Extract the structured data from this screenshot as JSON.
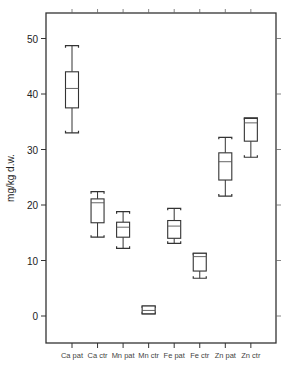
{
  "chart_data": {
    "type": "box",
    "title": "",
    "xlabel": "",
    "ylabel": "mg/kg d.w.",
    "ylim": [
      -5,
      55
    ],
    "yticks": [
      0,
      10,
      20,
      30,
      40,
      50
    ],
    "grid": false,
    "legend": null,
    "categories": [
      "Ca pat",
      "Ca ctr",
      "Mn pat",
      "Mn ctr",
      "Fe pat",
      "Fe ctr",
      "Zn pat",
      "Zn ctr"
    ],
    "series": [
      {
        "name": "Ca pat",
        "whisker_low": 33.0,
        "q1": 37.5,
        "median": 41.0,
        "q3": 44.0,
        "whisker_high": 48.7
      },
      {
        "name": "Ca ctr",
        "whisker_low": 14.2,
        "q1": 16.8,
        "median": 20.4,
        "q3": 21.1,
        "whisker_high": 22.4
      },
      {
        "name": "Mn pat",
        "whisker_low": 12.2,
        "q1": 14.2,
        "median": 16.0,
        "q3": 16.9,
        "whisker_high": 18.8
      },
      {
        "name": "Mn ctr",
        "whisker_low": 0.4,
        "q1": 0.4,
        "median": 1.0,
        "q3": 1.8,
        "whisker_high": 1.8
      },
      {
        "name": "Fe pat",
        "whisker_low": 13.1,
        "q1": 14.0,
        "median": 16.2,
        "q3": 17.2,
        "whisker_high": 19.4
      },
      {
        "name": "Fe ctr",
        "whisker_low": 6.8,
        "q1": 8.1,
        "median": 10.7,
        "q3": 11.3,
        "whisker_high": 11.3
      },
      {
        "name": "Zn pat",
        "whisker_low": 21.6,
        "q1": 24.5,
        "median": 27.8,
        "q3": 29.4,
        "whisker_high": 32.2
      },
      {
        "name": "Zn ctr",
        "whisker_low": 28.6,
        "q1": 31.5,
        "median": 34.8,
        "q3": 35.6,
        "whisker_high": 35.7
      }
    ]
  }
}
